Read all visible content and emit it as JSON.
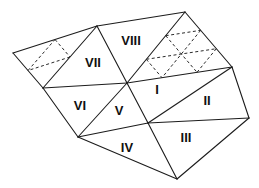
{
  "colors": {
    "background": "#ffffff",
    "solid_line": "#1c1c1c",
    "dashed_line": "#2a2a2a",
    "label": "#111111"
  },
  "diagram": {
    "width": 259,
    "height": 188,
    "vertices": {
      "L": [
        13,
        53
      ],
      "T1": [
        97,
        26
      ],
      "T2": [
        185,
        12
      ],
      "R1": [
        232,
        67
      ],
      "R2": [
        249,
        118
      ],
      "B1": [
        177,
        179
      ],
      "B2": [
        78,
        137
      ],
      "B3": [
        43,
        88
      ],
      "C": [
        127,
        83
      ],
      "D": [
        148,
        123
      ]
    },
    "solid_edges": [
      [
        "L",
        "T1"
      ],
      [
        "T1",
        "T2"
      ],
      [
        "T2",
        "R1"
      ],
      [
        "R1",
        "R2"
      ],
      [
        "R2",
        "B1"
      ],
      [
        "B1",
        "B2"
      ],
      [
        "B2",
        "B3"
      ],
      [
        "B3",
        "L"
      ],
      [
        "T1",
        "B3"
      ],
      [
        "T1",
        "C"
      ],
      [
        "T2",
        "C"
      ],
      [
        "C",
        "R1"
      ],
      [
        "B3",
        "C"
      ],
      [
        "B2",
        "C"
      ],
      [
        "C",
        "D"
      ],
      [
        "D",
        "B1"
      ],
      [
        "B2",
        "D"
      ],
      [
        "D",
        "R1"
      ],
      [
        "D",
        "R2"
      ]
    ],
    "dashed_edges": [
      [
        [
          55,
          39.5
        ],
        [
          70,
          57
        ]
      ],
      [
        [
          70,
          57
        ],
        [
          28,
          70.5
        ]
      ],
      [
        [
          28,
          70.5
        ],
        [
          55,
          39.5
        ]
      ],
      [
        [
          165.7,
          35.7
        ],
        [
          200.7,
          30.3
        ]
      ],
      [
        [
          146.3,
          59.3
        ],
        [
          216.3,
          48.7
        ]
      ],
      [
        [
          216.3,
          48.7
        ],
        [
          197,
          72.3
        ]
      ],
      [
        [
          200.7,
          30.3
        ],
        [
          162,
          77.7
        ]
      ],
      [
        [
          146.3,
          59.3
        ],
        [
          162,
          77.7
        ]
      ],
      [
        [
          165.7,
          35.7
        ],
        [
          197,
          72.3
        ]
      ]
    ],
    "labels": [
      {
        "text": "I",
        "x": 157,
        "y": 89
      },
      {
        "text": "II",
        "x": 207,
        "y": 100
      },
      {
        "text": "III",
        "x": 186,
        "y": 137
      },
      {
        "text": "IV",
        "x": 127,
        "y": 147
      },
      {
        "text": "V",
        "x": 119,
        "y": 110
      },
      {
        "text": "VI",
        "x": 80,
        "y": 105
      },
      {
        "text": "VII",
        "x": 93,
        "y": 62
      },
      {
        "text": "VIII",
        "x": 131,
        "y": 40
      }
    ]
  }
}
